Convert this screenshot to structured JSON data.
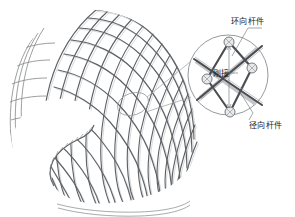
{
  "figure": {
    "title": "",
    "background_color": "#ffffff"
  },
  "labels": {
    "hoop_member": "环向杆件",
    "rigid_connection": "刚接",
    "radial_member": "径向杆件"
  },
  "colors": {
    "mesh_line": "#5f6266",
    "mesh_line_light": "#8d9094",
    "detail_circle": "#8a8d91",
    "bar_dark": "#4a4d51",
    "bar_light": "#c3c5c8",
    "node_fill": "#e8e9ea",
    "node_stroke": "#6a6d71",
    "leader_line": "#9a9da1",
    "text": "#1a1a1a"
  },
  "detail_view": {
    "center_x": 228,
    "center_y": 75,
    "radius": 40,
    "node_count": 4,
    "nodes": [
      {
        "id": "node-top",
        "x": 229,
        "y": 42
      },
      {
        "id": "node-left",
        "x": 207,
        "y": 79
      },
      {
        "id": "node-right",
        "x": 252,
        "y": 68
      },
      {
        "id": "node-bottom",
        "x": 230,
        "y": 112
      }
    ]
  },
  "callout": {
    "source_x": 133,
    "source_y": 104,
    "source_radius_x": 16,
    "source_radius_y": 11
  }
}
